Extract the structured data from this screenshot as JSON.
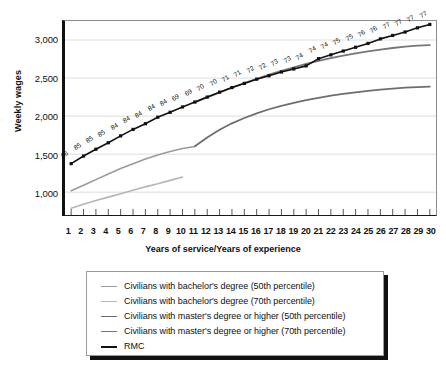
{
  "chart_data": {
    "type": "line",
    "title": "",
    "xlabel": "Years of service/Years of experience",
    "ylabel": "Weekly wages",
    "xlim": [
      0.5,
      30.5
    ],
    "ylim": [
      700,
      3250
    ],
    "yticks": [
      "1,000",
      "1,500",
      "2,000",
      "2,500",
      "3,000"
    ],
    "ytick_values": [
      1000,
      1500,
      2000,
      2500,
      3000
    ],
    "xticks": [
      "1",
      "2",
      "3",
      "4",
      "5",
      "6",
      "7",
      "8",
      "9",
      "10",
      "11",
      "12",
      "13",
      "14",
      "15",
      "16",
      "17",
      "18",
      "19",
      "20",
      "21",
      "22",
      "23",
      "24",
      "25",
      "26",
      "27",
      "28",
      "29",
      "30"
    ],
    "grid": "horizontal",
    "legend_position": "below",
    "x": [
      1,
      2,
      3,
      4,
      5,
      6,
      7,
      8,
      9,
      10,
      11,
      12,
      13,
      14,
      15,
      16,
      17,
      18,
      19,
      20,
      21,
      22,
      23,
      24,
      25,
      26,
      27,
      28,
      29,
      30
    ],
    "series": [
      {
        "name": "Civilians with bachelor's degree (50th percentile)",
        "color": "#9a9a9a",
        "width": 1.6,
        "x": [
          1,
          2,
          3,
          4,
          5,
          6,
          7,
          8,
          9,
          10,
          11
        ],
        "values": [
          1020,
          1090,
          1165,
          1240,
          1310,
          1375,
          1435,
          1490,
          1535,
          1575,
          1600
        ]
      },
      {
        "name": "Civilians with bachelor's degree (70th percentile)",
        "color": "#b5b5b5",
        "width": 1.6,
        "x": [
          1,
          2,
          3,
          4,
          5,
          6,
          7,
          8,
          9,
          10
        ],
        "values": [
          790,
          840,
          890,
          935,
          980,
          1025,
          1070,
          1110,
          1155,
          1200
        ]
      },
      {
        "name": "Civilians with master's degree or higher (50th percentile)",
        "color": "#6e6e6e",
        "width": 1.8,
        "x": [
          11,
          12,
          13,
          14,
          15,
          16,
          17,
          18,
          19,
          20,
          21,
          22,
          23,
          24,
          25,
          26,
          27,
          28,
          29,
          30
        ],
        "values": [
          1605,
          1720,
          1820,
          1905,
          1975,
          2035,
          2090,
          2135,
          2175,
          2210,
          2240,
          2268,
          2292,
          2313,
          2332,
          2348,
          2362,
          2374,
          2382,
          2388
        ]
      },
      {
        "name": "Civilians with master's degree or higher (70th percentile)",
        "color": "#767676",
        "width": 1.8,
        "x": [
          11,
          12,
          13,
          14,
          15,
          16,
          17,
          18,
          19,
          20,
          21,
          22,
          23,
          24,
          25,
          26,
          27,
          28,
          29,
          30
        ],
        "values": [
          2180,
          2245,
          2310,
          2375,
          2435,
          2490,
          2545,
          2595,
          2640,
          2685,
          2725,
          2762,
          2795,
          2825,
          2852,
          2875,
          2895,
          2912,
          2925,
          2933
        ]
      },
      {
        "name": "RMC",
        "color": "#111111",
        "width": 1.6,
        "markers": true,
        "x": [
          1,
          2,
          3,
          4,
          5,
          6,
          7,
          8,
          9,
          10,
          11,
          12,
          13,
          14,
          15,
          16,
          17,
          18,
          19,
          20,
          21,
          22,
          23,
          24,
          25,
          26,
          27,
          28,
          29,
          30
        ],
        "values": [
          1375,
          1475,
          1565,
          1650,
          1740,
          1825,
          1900,
          1985,
          2050,
          2120,
          2185,
          2250,
          2315,
          2375,
          2430,
          2485,
          2530,
          2580,
          2620,
          2660,
          2755,
          2805,
          2855,
          2905,
          2955,
          3015,
          3060,
          3105,
          3160,
          3205
        ],
        "point_labels": [
          "86",
          "85",
          "85",
          "85",
          "84",
          "84",
          "84",
          "84",
          "84",
          "69",
          "69",
          "70",
          "70",
          "71",
          "71",
          "72",
          "72",
          "73",
          "73",
          "74",
          "74",
          "74",
          "75",
          "75",
          "76",
          "76",
          "77",
          "77",
          "77",
          "77"
        ]
      }
    ]
  },
  "legend": {
    "items": [
      {
        "label": "Civilians with bachelor's degree (50th percentile)",
        "color": "#9a9a9a",
        "width": "1.6px"
      },
      {
        "label": "Civilians with bachelor's degree (70th percentile)",
        "color": "#b5b5b5",
        "width": "1.6px"
      },
      {
        "label": "Civilians with master's degree or higher (50th percentile)",
        "color": "#6e6e6e",
        "width": "1.8px"
      },
      {
        "label": "Civilians with master's degree or higher (70th percentile)",
        "color": "#767676",
        "width": "1.8px"
      },
      {
        "label": "RMC",
        "color": "#111111",
        "width": "2.4px"
      }
    ]
  }
}
